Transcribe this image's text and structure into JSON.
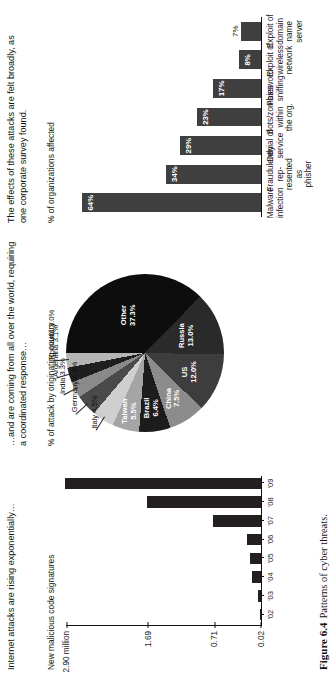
{
  "figure": {
    "number": "Figure 6.4",
    "caption": "Patterns of cyber threats."
  },
  "panels": [
    {
      "note": "Internet attacks are rising exponentially…",
      "axis_title": "New malicious code signatures"
    },
    {
      "note": "…and are coming from all over the world, requiring a coordinated response…",
      "axis_title": "% of attack by originating country"
    },
    {
      "note": "The effects of these attacks are felt broadly, as one corporate survey found.",
      "axis_title": "% of organizations affected"
    }
  ],
  "chart_data": [
    {
      "type": "bar",
      "title": "Internet attacks are rising exponentially…",
      "ylabel": "New malicious code signatures",
      "xlabel": "",
      "categories": [
        "'02",
        "'03",
        "'04",
        "'05",
        "'06",
        "'07",
        "'08",
        "'09"
      ],
      "values": [
        0.02,
        0.05,
        0.14,
        0.17,
        0.21,
        0.71,
        1.69,
        2.9
      ],
      "ytick_labels": [
        "0.02",
        "0.71",
        "1.69",
        "2.90 million"
      ],
      "ytick_values": [
        0.02,
        0.71,
        1.69,
        2.9
      ],
      "ylim": [
        0,
        2.9
      ],
      "grid": false,
      "legend": "none"
    },
    {
      "type": "pie",
      "title": "…and are coming from all over the world, requiring a coordinated response…",
      "ylabel": "% of attack by originating country",
      "labels": [
        "Other",
        "Russia",
        "US",
        "China",
        "Brazil",
        "Taiwan",
        "Italy",
        "Germany",
        "India",
        "Argentina",
        "Romania"
      ],
      "values": [
        37.3,
        13.0,
        12.0,
        7.5,
        6.4,
        5.5,
        4.5,
        4.4,
        3.3,
        3.1,
        3.0
      ],
      "value_labels": [
        "Other 37.3%",
        "Russia 13.0%",
        "US 12.0%",
        "China 7.5%",
        "Brazil 6.4%",
        "Taiwan 5.5%",
        "Italy 4.5%",
        "Germany 4.4%",
        "India 3.3%",
        "Argentina 3.1%",
        "Romania 3.0%"
      ],
      "legend": "none"
    },
    {
      "type": "bar",
      "title": "The effects of these attacks are felt broadly, as one corporate survey found.",
      "ylabel": "% of organizations affected",
      "categories": [
        "Malware infection",
        "Fraudulently rep-\nresented as phisher",
        "Denial of service",
        "Bots/zombies\nwithin the org.",
        "Password sniffing",
        "Exploit of\nwireless network",
        "Exploit of domain\nname server"
      ],
      "values": [
        64,
        34,
        29,
        23,
        17,
        8,
        7
      ],
      "value_labels": [
        "64%",
        "34%",
        "29%",
        "23%",
        "17%",
        "8%",
        "7%"
      ],
      "ylim": [
        0,
        70
      ],
      "grid": false,
      "legend": "none"
    }
  ],
  "pie_slices": [
    {
      "label": "Other 37.3%",
      "value": 37.3,
      "color": "#0d0d0d"
    },
    {
      "label": "Russia 13.0%",
      "value": 13.0,
      "color": "#2a2a2a"
    },
    {
      "label": "US 12.0%",
      "value": 12.0,
      "color": "#3d3d3d"
    },
    {
      "label": "China 7.5%",
      "value": 7.5,
      "color": "#8c8c8c"
    },
    {
      "label": "Brazil 6.4%",
      "value": 6.4,
      "color": "#1c1c1c"
    },
    {
      "label": "Taiwan 5.5%",
      "value": 5.5,
      "color": "#a5a5a5"
    },
    {
      "label": "Italy 4.5%",
      "value": 4.5,
      "color": "#cfcfcf"
    },
    {
      "label": "Germany 4.4%",
      "value": 4.4,
      "color": "#4a4a4a"
    },
    {
      "label": "India 3.3%",
      "value": 3.3,
      "color": "#8a8a8a"
    },
    {
      "label": "Argentina 3.1%",
      "value": 3.1,
      "color": "#1f1f1f"
    },
    {
      "label": "Romania 3.0%",
      "value": 3.0,
      "color": "#b5b5b5"
    }
  ],
  "colors": {
    "bar_dark": "#231f20",
    "bar_gray": "#3f3f3f",
    "axis": "#111111",
    "text": "#1a1a1a",
    "background": "#ffffff"
  }
}
